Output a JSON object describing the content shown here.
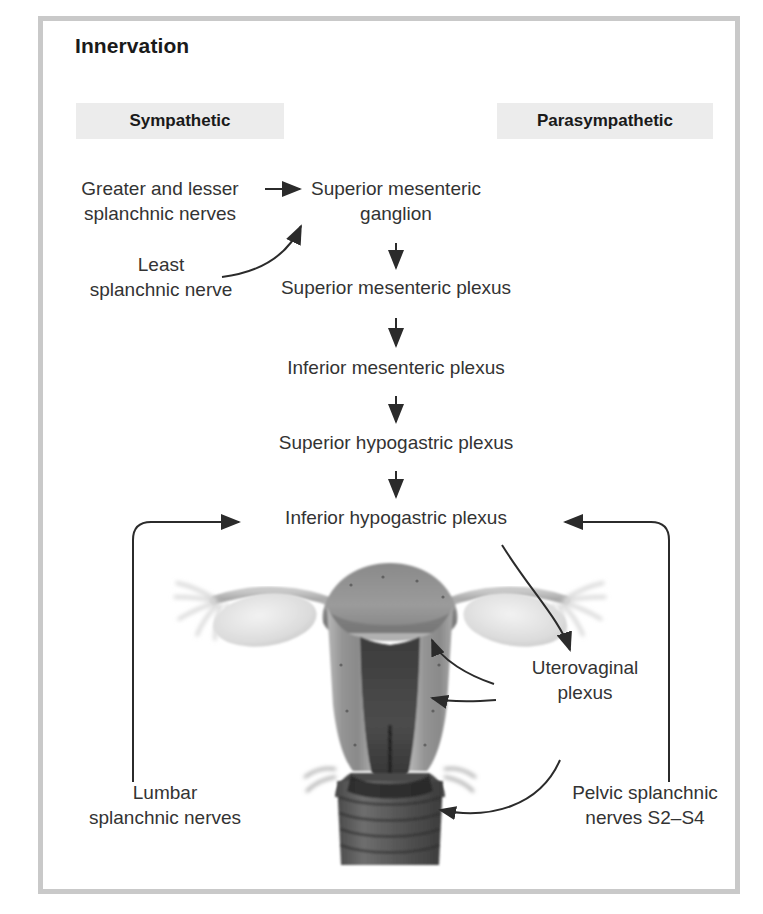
{
  "panel": {
    "title": "Innervation",
    "border_color": "#c9c9c9",
    "background": "#ffffff"
  },
  "columns": [
    {
      "id": "sympathetic",
      "label": "Sympathetic",
      "band_color": "#ececec"
    },
    {
      "id": "parasympathetic",
      "label": "Parasympathetic",
      "band_color": "#ececec"
    }
  ],
  "nodes": {
    "greater_lesser_splanchnic": "Greater and lesser\nsplanchnic nerves",
    "least_splanchnic": "Least\nsplanchnic nerve",
    "superior_mesenteric_ganglion": "Superior mesenteric\nganglion",
    "superior_mesenteric_plexus": "Superior mesenteric plexus",
    "inferior_mesenteric_plexus": "Inferior mesenteric plexus",
    "superior_hypogastric_plexus": "Superior hypogastric plexus",
    "inferior_hypogastric_plexus": "Inferior hypogastric plexus",
    "uterovaginal_plexus": "Uterovaginal\nplexus",
    "lumbar_splanchnic": "Lumbar\nsplanchnic nerves",
    "pelvic_splanchnic": "Pelvic splanchnic\nnerves S2–S4"
  },
  "illustration": {
    "caption": "coronal-section-uterus-ovaries-fallopian-tubes-vagina",
    "tone_dark": "#3a3a3a",
    "tone_mid": "#8f8f8f",
    "tone_light": "#d8d8d8"
  },
  "arrow_color": "#2b2b2b"
}
